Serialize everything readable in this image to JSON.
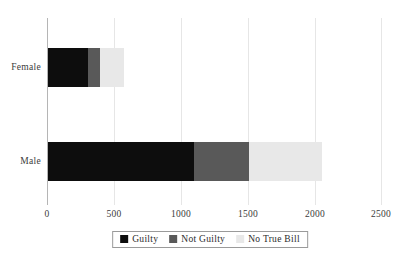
{
  "chart_data": {
    "type": "bar",
    "orientation": "horizontal",
    "stacked": true,
    "title": "",
    "subtitle": "",
    "xlabel": "",
    "ylabel": "",
    "categories": [
      "Female",
      "Male"
    ],
    "series": [
      {
        "name": "Guilty",
        "color": "#0d0d0d",
        "values": [
          305,
          1095
        ]
      },
      {
        "name": "Not Guilty",
        "color": "#595959",
        "values": [
          90,
          410
        ]
      },
      {
        "name": "No True Bill",
        "color": "#e8e8e8",
        "values": [
          180,
          545
        ]
      }
    ],
    "totals": [
      575,
      2050
    ],
    "xlim": [
      0,
      2500
    ],
    "xticks": [
      0,
      500,
      1000,
      1500,
      2000,
      2500
    ],
    "xtick_labels": [
      "0",
      "500",
      "1000",
      "1500",
      "2000",
      "2500"
    ],
    "grid": true,
    "grid_axis": "x",
    "legend_position": "bottom",
    "legend_entries": [
      "Guilty",
      "Not Guilty",
      "No True Bill"
    ]
  },
  "colors": {
    "guilty": "#0d0d0d",
    "not_guilty": "#595959",
    "no_true_bill": "#e8e8e8",
    "gridline": "#e6e6e6",
    "axis_line": "#b5b5b5",
    "text": "#3b3b3b",
    "legend_border": "#9a9a9a",
    "background": "#ffffff"
  },
  "axis": {
    "x_tick_0": "0",
    "x_tick_1": "500",
    "x_tick_2": "1000",
    "x_tick_3": "1500",
    "x_tick_4": "2000",
    "x_tick_5": "2500"
  },
  "categories": {
    "female": "Female",
    "male": "Male"
  },
  "legend": {
    "guilty": "Guilty",
    "not_guilty": "Not Guilty",
    "no_true_bill": "No True Bill"
  }
}
